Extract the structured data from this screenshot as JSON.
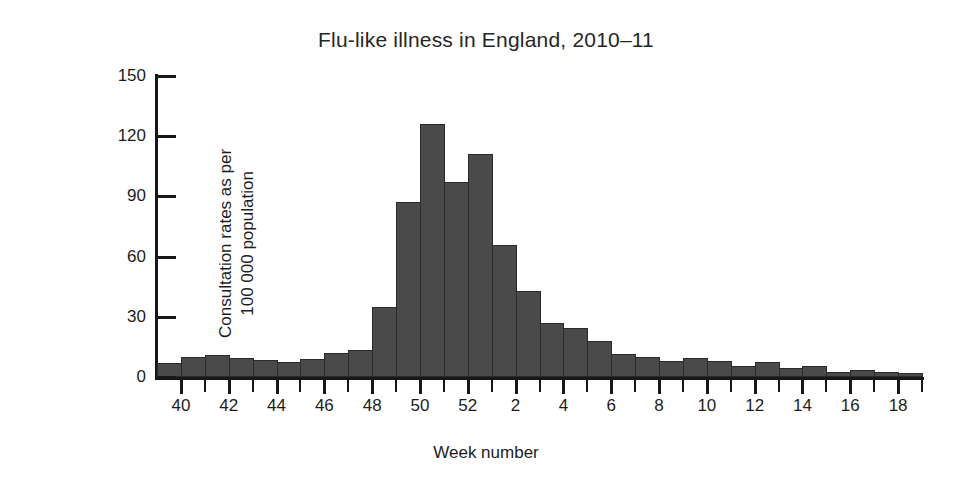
{
  "chart_data": {
    "type": "bar",
    "title": "Flu-like illness in England, 2010–11",
    "xlabel": "Week number",
    "ylabel": "Consultation rates as per 100 000 population",
    "ylabel_line1": "Consultation rates as per",
    "ylabel_line2": "100 000 population",
    "ylim": [
      0,
      150
    ],
    "yticks": [
      0,
      30,
      60,
      90,
      120,
      150
    ],
    "ytick_labels": [
      "0",
      "30",
      "60",
      "90",
      "120",
      "150"
    ],
    "grid": false,
    "legend": null,
    "bar_color": "#4a4a4a",
    "bar_edge_color": "#2b2b2b",
    "axis_color": "#171717",
    "xtick_labels": [
      "40",
      "42",
      "44",
      "46",
      "48",
      "50",
      "52",
      "2",
      "4",
      "6",
      "8",
      "10",
      "12",
      "14",
      "16",
      "18"
    ],
    "categories": [
      "40",
      "41",
      "42",
      "43",
      "44",
      "45",
      "46",
      "47",
      "48",
      "49",
      "50",
      "51",
      "52",
      "1",
      "2",
      "3",
      "4",
      "5",
      "6",
      "7",
      "8",
      "9",
      "10",
      "11",
      "12",
      "13",
      "14",
      "15",
      "16",
      "17",
      "18",
      "19"
    ],
    "values": [
      7,
      10,
      11,
      9.5,
      8.5,
      7.5,
      9,
      12,
      13.5,
      35,
      87,
      126,
      97,
      111,
      66,
      43,
      27,
      24.5,
      18,
      11.5,
      10,
      8,
      9.5,
      8,
      5.5,
      7.5,
      4.5,
      5.5,
      2.5,
      3.5,
      2.5,
      2
    ],
    "xlabel_weeks": [
      "40",
      "42",
      "44",
      "46",
      "48",
      "50",
      "52",
      "2",
      "4",
      "6",
      "8",
      "10",
      "12",
      "14",
      "16",
      "18"
    ]
  }
}
